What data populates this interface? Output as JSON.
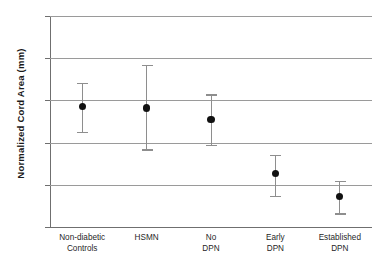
{
  "chart_data": {
    "type": "scatter",
    "title": "",
    "xlabel": "",
    "ylabel": "Normalized Cord Area (mm)",
    "ylim": [
      55,
      80
    ],
    "ytick_labels": [
      "80",
      "75",
      "70",
      "65",
      "60",
      "55"
    ],
    "yticks": [
      80,
      75,
      70,
      65,
      60,
      55
    ],
    "grid": true,
    "legend": "none",
    "error_bars": "mean with upper and lower limits",
    "categories": [
      "Non-diabetic Controls",
      "HSMN",
      "No DPN",
      "Early DPN",
      "Established DPN"
    ],
    "category_lines": [
      [
        "Non-diabetic",
        "Controls"
      ],
      [
        "HSMN",
        ""
      ],
      [
        "No",
        "DPN"
      ],
      [
        "Early",
        "DPN"
      ],
      [
        "Established",
        "DPN"
      ]
    ],
    "values": [
      69.3,
      69.1,
      67.7,
      61.3,
      58.6
    ],
    "error_low": [
      66.3,
      64.2,
      64.7,
      58.7,
      56.6
    ],
    "error_high": [
      72.1,
      74.2,
      70.7,
      63.5,
      60.5
    ],
    "marker_color": "#111111",
    "errorbar_color": "#8e8e8e",
    "gridline_color": "#9a9a9a",
    "axis_color": "#6f6f6f",
    "background_color": "#ffffff"
  }
}
